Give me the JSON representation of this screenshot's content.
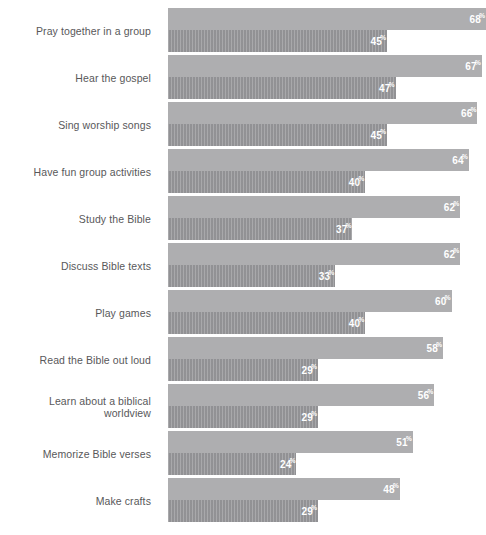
{
  "chart_data": {
    "type": "bar",
    "title": "",
    "subtitle": "",
    "xlabel": "",
    "ylabel": "",
    "orientation": "horizontal",
    "grid": false,
    "legend_position": "none",
    "value_suffix": "%",
    "xlim": [
      0,
      68
    ],
    "categories": [
      "Pray together in a group",
      "Hear the gospel",
      "Sing worship songs",
      "Have fun group activities",
      "Study the Bible",
      "Discuss Bible texts",
      "Play games",
      "Read the Bible out loud",
      "Learn about a biblical worldview",
      "Memorize Bible verses",
      "Make crafts"
    ],
    "series": [
      {
        "name": "series-1",
        "color": "#aeaeb0",
        "values": [
          68,
          67,
          66,
          64,
          62,
          62,
          60,
          58,
          56,
          51,
          48
        ]
      },
      {
        "name": "series-2",
        "color": "#98989b",
        "values": [
          45,
          47,
          45,
          40,
          37,
          33,
          40,
          29,
          29,
          24,
          29
        ]
      }
    ],
    "rows": [
      {
        "label": "Pray together in a group",
        "top": 68,
        "bottom": 45
      },
      {
        "label": "Hear the gospel",
        "top": 67,
        "bottom": 47
      },
      {
        "label": "Sing worship songs",
        "top": 66,
        "bottom": 45
      },
      {
        "label": "Have fun group activities",
        "top": 64,
        "bottom": 40
      },
      {
        "label": "Study the Bible",
        "top": 62,
        "bottom": 37
      },
      {
        "label": "Discuss Bible texts",
        "top": 62,
        "bottom": 33
      },
      {
        "label": "Play games",
        "top": 60,
        "bottom": 40
      },
      {
        "label": "Read the Bible out loud",
        "top": 58,
        "bottom": 29
      },
      {
        "label": "Learn about a biblical worldview",
        "top": 56,
        "bottom": 29
      },
      {
        "label": "Memorize Bible verses",
        "top": 51,
        "bottom": 24
      },
      {
        "label": "Make crafts",
        "top": 48,
        "bottom": 29
      }
    ]
  }
}
